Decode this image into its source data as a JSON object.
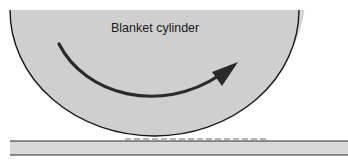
{
  "diagram": {
    "title": "Blanket cylinder",
    "components": [
      {
        "id": "blanket-cylinder",
        "label": "Blanket cylinder",
        "fill": "#cfcfcf",
        "stroke": "#1a1a1a"
      },
      {
        "id": "rotation-arrow",
        "meaning": "clockwise rotation direction",
        "color": "#2a2a2a"
      },
      {
        "id": "ink-layer",
        "meaning": "ink transferred onto substrate",
        "color": "#b8b8b8"
      },
      {
        "id": "substrate",
        "fill": "#d9d9d9",
        "stroke": "#2a2a2a"
      }
    ]
  }
}
